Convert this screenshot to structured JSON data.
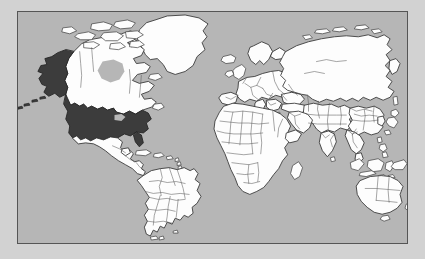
{
  "figure": {
    "kind": "world-map",
    "projection": "mercator",
    "title": "",
    "caption": ""
  },
  "map": {
    "background_label": "ocean",
    "frame": {
      "x": 17,
      "y": 11,
      "width": 391,
      "height": 233
    },
    "colors": {
      "ocean": "#b6b6b6",
      "land": "#fdfdfd",
      "land_border": "#3b3b3b",
      "country_border": "#5a5a5a",
      "highlight": "#3c3c3c",
      "frame_border": "#555555",
      "page_background": "#d2d2d2"
    },
    "legend": {
      "visible": false,
      "entries": [
        {
          "label": "Highlighted country",
          "color": "#3c3c3c"
        },
        {
          "label": "Other countries",
          "color": "#fdfdfd"
        },
        {
          "label": "Ocean",
          "color": "#b6b6b6"
        }
      ]
    },
    "highlighted": {
      "name": "United States of America",
      "code": "USA",
      "regions": [
        "Contiguous United States",
        "Alaska"
      ],
      "fill": "#3c3c3c"
    },
    "regions": [
      {
        "name": "North America",
        "highlighted": true
      },
      {
        "name": "South America",
        "highlighted": false
      },
      {
        "name": "Europe",
        "highlighted": false
      },
      {
        "name": "Africa",
        "highlighted": false
      },
      {
        "name": "Asia",
        "highlighted": false
      },
      {
        "name": "Oceania",
        "highlighted": false
      }
    ],
    "landmasses": [
      {
        "name": "Alaska",
        "highlighted": true
      },
      {
        "name": "Contiguous United States",
        "highlighted": true
      },
      {
        "name": "Canada",
        "highlighted": false
      },
      {
        "name": "Greenland",
        "highlighted": false
      },
      {
        "name": "Mexico",
        "highlighted": false
      },
      {
        "name": "Central America",
        "highlighted": false
      },
      {
        "name": "Caribbean Islands",
        "highlighted": false
      },
      {
        "name": "South America",
        "highlighted": false
      },
      {
        "name": "Iceland",
        "highlighted": false
      },
      {
        "name": "British Isles",
        "highlighted": false
      },
      {
        "name": "Scandinavia",
        "highlighted": false
      },
      {
        "name": "Continental Europe",
        "highlighted": false
      },
      {
        "name": "Africa",
        "highlighted": false
      },
      {
        "name": "Madagascar",
        "highlighted": false
      },
      {
        "name": "Russia",
        "highlighted": false
      },
      {
        "name": "Middle East",
        "highlighted": false
      },
      {
        "name": "India",
        "highlighted": false
      },
      {
        "name": "China",
        "highlighted": false
      },
      {
        "name": "Mongolia",
        "highlighted": false
      },
      {
        "name": "Southeast Asia",
        "highlighted": false
      },
      {
        "name": "Japan",
        "highlighted": false
      },
      {
        "name": "Indonesia",
        "highlighted": false
      },
      {
        "name": "Philippines",
        "highlighted": false
      },
      {
        "name": "Papua New Guinea",
        "highlighted": false
      },
      {
        "name": "Australia",
        "highlighted": false
      },
      {
        "name": "New Zealand",
        "highlighted": false
      },
      {
        "name": "Sri Lanka",
        "highlighted": false
      },
      {
        "name": "Tasmania",
        "highlighted": false
      }
    ]
  }
}
